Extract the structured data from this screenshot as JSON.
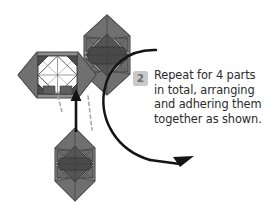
{
  "figure": {
    "kind": "origami-assembly-instruction",
    "step_badge": "2",
    "instruction_lines": [
      "Repeat for 4 parts",
      "in total, arranging",
      "and adhering them",
      "together as shown."
    ],
    "instruction_full": "Repeat for 4 parts in total, arranging and adhering them together as shown."
  },
  "colors": {
    "background": "#ffffff",
    "text": "#2b2b2b",
    "badge_fill": "#c9c9c9",
    "badge_text": "#6e6e6e",
    "arrow_black": "#141414",
    "dashed_guide": "#a8a8a8",
    "paper_light": "#8e8e8e",
    "paper_mid": "#6f6f6f",
    "paper_dark": "#555555",
    "paper_darkest": "#3f3f3f",
    "paper_white": "#fdfdfd",
    "fold_line": "#3a3a3a"
  },
  "modules": [
    {
      "name": "left-module",
      "label": "hexagonal paper module with white square-in-diamond face",
      "position": "left",
      "center_x": 57,
      "center_y": 75
    },
    {
      "name": "top-module",
      "label": "hexagonal paper module viewed from above",
      "position": "top",
      "center_x": 107,
      "center_y": 54
    },
    {
      "name": "bottom-module",
      "label": "hexagonal paper module being joined",
      "position": "bottom",
      "center_x": 75,
      "center_y": 164
    }
  ],
  "arrows": [
    {
      "name": "insert-arrow",
      "style": "solid-straight",
      "direction": "up",
      "meaning": "slide bottom module upward into place"
    },
    {
      "name": "rotate-arrow",
      "style": "solid-curved",
      "direction": "clockwise-sweep",
      "meaning": "arrange parts around in a circle"
    },
    {
      "name": "alignment-guide-left",
      "style": "dashed",
      "meaning": "alignment guide"
    },
    {
      "name": "alignment-guide-right",
      "style": "dashed",
      "meaning": "alignment guide"
    }
  ]
}
